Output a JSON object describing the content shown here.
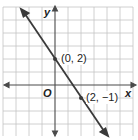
{
  "figure": {
    "axes": {
      "x_label": "x",
      "y_label": "y",
      "origin_label": "O"
    },
    "points": [
      {
        "label": "(0, 2)",
        "x": 0,
        "y": 2
      },
      {
        "label": "(2, −1)",
        "x": 2,
        "y": -1
      }
    ],
    "line": {
      "slope": -1.5,
      "intercept": 2
    },
    "grid": {
      "x_range": [
        -4,
        5
      ],
      "y_range": [
        -4,
        5
      ]
    },
    "colors": {
      "line": "#3a3a3a",
      "grid": "#bdbdbd",
      "axis": "#4a4a4a"
    }
  }
}
